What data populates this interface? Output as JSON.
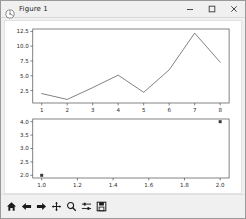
{
  "window": {
    "title": "Figure 1",
    "app_icon": "matplotlib-figure-icon",
    "controls": [
      {
        "name": "minimize-button",
        "glyph": "minimize"
      },
      {
        "name": "maximize-button",
        "glyph": "maximize"
      },
      {
        "name": "close-button",
        "glyph": "close"
      }
    ]
  },
  "toolbar": {
    "buttons": [
      {
        "name": "home-button",
        "icon": "home-icon",
        "tooltip": "Reset original view"
      },
      {
        "name": "back-button",
        "icon": "arrow-left-icon",
        "tooltip": "Back to previous view"
      },
      {
        "name": "forward-button",
        "icon": "arrow-right-icon",
        "tooltip": "Forward to next view"
      },
      {
        "name": "pan-button",
        "icon": "move-cross-icon",
        "tooltip": "Pan axes with left mouse, zoom with right"
      },
      {
        "name": "zoom-button",
        "icon": "magnifier-icon",
        "tooltip": "Zoom to rectangle"
      },
      {
        "name": "subplots-button",
        "icon": "sliders-icon",
        "tooltip": "Configure subplots"
      },
      {
        "name": "save-button",
        "icon": "floppy-disk-icon",
        "tooltip": "Save the figure"
      }
    ]
  },
  "colors": {
    "line": "#6b6b6b",
    "marker": "#3a3a3a",
    "axis": "#4d4d4d",
    "tick_label": "#2b2b2b",
    "figure_background": "#ffffff",
    "window_background": "#f0f0f0"
  },
  "chart_data": [
    {
      "id": "upper-line-plot",
      "type": "line",
      "title": "",
      "xlabel": "",
      "ylabel": "",
      "x": [
        1,
        2,
        3,
        4,
        5,
        6,
        7,
        8
      ],
      "values": [
        2.0,
        1.0,
        3.0,
        5.1,
        2.2,
        6.0,
        12.2,
        7.3
      ],
      "xticks": [
        1,
        2,
        3,
        4,
        5,
        6,
        7,
        8
      ],
      "xticklabels": [
        "1",
        "2",
        "3",
        "4",
        "5",
        "6",
        "7",
        "8"
      ],
      "yticks": [
        2.5,
        5.0,
        7.5,
        10.0,
        12.5
      ],
      "yticklabels": [
        "2.5",
        "5.0",
        "7.5",
        "10.0",
        "12.5"
      ],
      "xlim": [
        0.65,
        8.35
      ],
      "ylim": [
        0.4,
        12.9
      ],
      "grid": false,
      "legend": null
    },
    {
      "id": "lower-scatter-plot",
      "type": "scatter",
      "title": "",
      "xlabel": "",
      "ylabel": "",
      "x": [
        1.0,
        2.0
      ],
      "values": [
        2.0,
        4.0
      ],
      "xticks": [
        1.0,
        1.2,
        1.4,
        1.6,
        1.8,
        2.0
      ],
      "xticklabels": [
        "1.0",
        "1.2",
        "1.4",
        "1.6",
        "1.8",
        "2.0"
      ],
      "yticks": [
        2.0,
        2.5,
        3.0,
        3.5,
        4.0
      ],
      "yticklabels": [
        "2.0",
        "2.5",
        "3.0",
        "3.5",
        "4.0"
      ],
      "xlim": [
        0.95,
        2.05
      ],
      "ylim": [
        1.9,
        4.1
      ],
      "grid": false,
      "legend": null
    }
  ]
}
